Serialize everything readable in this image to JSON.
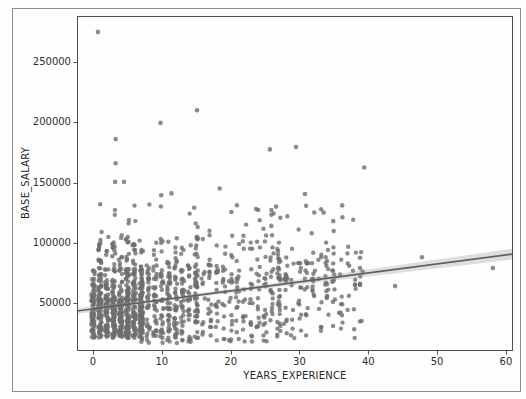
{
  "figure": {
    "background": "#fefefe",
    "frame_color": "#8f8f8f"
  },
  "axes": {
    "spine_color": "#4f4f4f",
    "tick_color": "#4f4f4f",
    "tick_label_color": "#2e2e2e",
    "axis_label_color": "#262626"
  },
  "chart_data": {
    "type": "scatter",
    "title": "",
    "xlabel": "YEARS_EXPERIENCE",
    "ylabel": "BASE_SALARY",
    "x_ticks": [
      0,
      10,
      20,
      30,
      40,
      50,
      60
    ],
    "y_ticks": [
      50000,
      100000,
      150000,
      200000,
      250000
    ],
    "xlim": [
      -2.33,
      60.88
    ],
    "ylim": [
      11000,
      288200
    ],
    "grid": false,
    "legend": "none",
    "point_color": "#6e6e6e",
    "point_opacity": 0.8,
    "point_radius": 2.2,
    "line_color": "#5f5f5f",
    "band_color": "#9a9a9a",
    "regression": {
      "intercept": 45120,
      "slope": 747,
      "x_start": -2.33,
      "x_end": 60.88,
      "band_x": [
        -2.33,
        10,
        25,
        40,
        60.88
      ],
      "band_halfwidth": [
        2500,
        1300,
        1700,
        2900,
        4600
      ]
    },
    "outlier_points": [
      [
        0.7,
        275000
      ],
      [
        3.3,
        186000
      ],
      [
        3.3,
        166000
      ],
      [
        3.2,
        150500
      ],
      [
        4.5,
        150500
      ],
      [
        9.8,
        199500
      ],
      [
        15.1,
        210000
      ],
      [
        9.9,
        139500
      ],
      [
        11.4,
        141000
      ],
      [
        18.4,
        145000
      ],
      [
        25.7,
        177500
      ],
      [
        29.5,
        179500
      ],
      [
        39.4,
        162500
      ],
      [
        30.8,
        140500
      ],
      [
        23.7,
        128000
      ],
      [
        26.6,
        130000
      ],
      [
        25.9,
        114000
      ],
      [
        14.7,
        129000
      ],
      [
        20.1,
        125500
      ],
      [
        36.2,
        131000
      ],
      [
        33.5,
        125000
      ],
      [
        34.9,
        118000
      ],
      [
        38.8,
        87500
      ],
      [
        38.8,
        79000
      ],
      [
        47.8,
        88000
      ],
      [
        58.1,
        79000
      ],
      [
        43.9,
        64000
      ],
      [
        38.8,
        66000
      ]
    ],
    "cluster_points_spec": {
      "seed": 42,
      "x_columns_integer": true,
      "clusters": [
        {
          "count": 420,
          "x": [
            0,
            7
          ],
          "y": [
            21000,
            52000
          ],
          "bias": "uniform"
        },
        {
          "count": 200,
          "x": [
            0,
            7
          ],
          "y": [
            52000,
            78000
          ],
          "bias": "low"
        },
        {
          "count": 60,
          "x": [
            1,
            6
          ],
          "y": [
            78000,
            108000
          ],
          "bias": "low"
        },
        {
          "count": 260,
          "x": [
            7,
            15
          ],
          "y": [
            16000,
            75000
          ],
          "bias": "uniform"
        },
        {
          "count": 55,
          "x": [
            7,
            15
          ],
          "y": [
            75000,
            105000
          ],
          "bias": "low"
        },
        {
          "count": 170,
          "x": [
            15,
            27
          ],
          "y": [
            17000,
            78000
          ],
          "bias": "uniform"
        },
        {
          "count": 50,
          "x": [
            15,
            27
          ],
          "y": [
            78000,
            106000
          ],
          "bias": "low"
        },
        {
          "count": 90,
          "x": [
            27,
            39
          ],
          "y": [
            20000,
            73000
          ],
          "bias": "uniform"
        },
        {
          "count": 40,
          "x": [
            27,
            39
          ],
          "y": [
            73000,
            100000
          ],
          "bias": "low"
        },
        {
          "count": 32,
          "x": [
            1,
            38
          ],
          "y": [
            105000,
            134000
          ],
          "bias": "uniform"
        },
        {
          "count": 12,
          "x": [
            29,
            37
          ],
          "y": [
            82500,
            83500
          ],
          "bias": "uniform"
        },
        {
          "count": 10,
          "x": [
            27,
            34
          ],
          "y": [
            69500,
            70500
          ],
          "bias": "uniform"
        }
      ]
    }
  }
}
